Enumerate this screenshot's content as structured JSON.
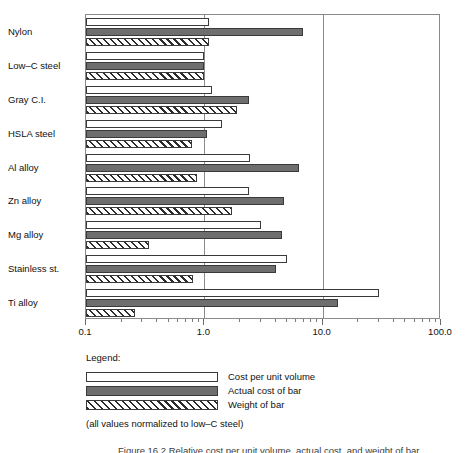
{
  "chart_data": {
    "type": "bar",
    "orientation": "horizontal",
    "title": "",
    "xlabel": "",
    "ylabel": "",
    "xscale": "log",
    "xlim": [
      0.1,
      100.0
    ],
    "grid": true,
    "gridlines": [
      0.1,
      1.0,
      10.0,
      100.0
    ],
    "tick_labels": [
      "0.1",
      "1.0",
      "10.0",
      "100.0"
    ],
    "categories": [
      "Nylon",
      "Low–C steel",
      "Gray C.I.",
      "HSLA steel",
      "Al alloy",
      "Zn alloy",
      "Mg alloy",
      "Stainless st.",
      "Ti alloy"
    ],
    "series": [
      {
        "name": "Cost per unit volume",
        "style": "white",
        "values": [
          1.1,
          1.0,
          1.15,
          1.4,
          2.45,
          2.4,
          3.0,
          5.0,
          30.0
        ]
      },
      {
        "name": "Actual cost of bar",
        "style": "solid-gray",
        "values": [
          6.8,
          1.0,
          2.4,
          1.05,
          6.3,
          4.7,
          4.5,
          4.0,
          13.5
        ]
      },
      {
        "name": "Weight of bar",
        "style": "hatched",
        "values": [
          1.1,
          1.0,
          1.9,
          0.78,
          0.86,
          1.7,
          0.34,
          0.8,
          0.26
        ]
      }
    ],
    "legend_position": "below",
    "annotations": [
      "(all values normalized to low–C steel)"
    ]
  },
  "legend": {
    "title": "Legend:",
    "entries": [
      {
        "label": "Cost per unit volume",
        "style": "white"
      },
      {
        "label": "Actual cost of bar",
        "style": "solid-gray"
      },
      {
        "label": "Weight of bar",
        "style": "hatched"
      }
    ]
  },
  "notes": {
    "normalized": "(all values normalized to low–C steel)",
    "caption_partial": "Figure  16.2    Relative cost per unit volume, actual cost, and weight of bar"
  },
  "colors": {
    "bar_white": "#ffffff",
    "bar_gray": "#6e6e6e",
    "hatch_line": "#2b2b2b",
    "outline": "#3a3a3a",
    "frame": "#8b8b8b",
    "text": "#111111"
  }
}
